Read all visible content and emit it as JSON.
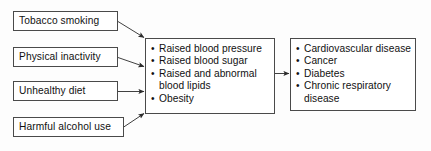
{
  "diagram": {
    "colors": {
      "box_border": "#4a4a4a",
      "arrow": "#333333",
      "text": "#111111",
      "background": "#fdfdfd"
    },
    "risk_factors": [
      {
        "label": "Tobacco smoking"
      },
      {
        "label": "Physical inactivity"
      },
      {
        "label": "Unhealthy diet"
      },
      {
        "label": "Harmful alcohol use"
      }
    ],
    "intermediate": {
      "items": [
        {
          "line1": "Raised blood pressure",
          "line2": ""
        },
        {
          "line1": "Raised blood sugar",
          "line2": ""
        },
        {
          "line1": "Raised and abnormal",
          "line2": "blood lipids"
        },
        {
          "line1": "Obesity",
          "line2": ""
        }
      ]
    },
    "outcomes": {
      "items": [
        {
          "line1": "Cardiovascular disease",
          "line2": ""
        },
        {
          "line1": "Cancer",
          "line2": ""
        },
        {
          "line1": "Diabetes",
          "line2": ""
        },
        {
          "line1": "Chronic respiratory",
          "line2": "disease"
        }
      ]
    },
    "bullet_glyph": "•"
  }
}
